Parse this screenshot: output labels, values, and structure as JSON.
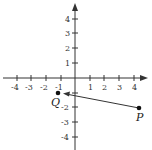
{
  "diagram": {
    "type": "coordinate-plane",
    "axes": {
      "x_ticks": [
        "-4",
        "-3",
        "-2",
        "-1",
        "1",
        "2",
        "3",
        "4"
      ],
      "y_ticks": [
        "4",
        "3",
        "2",
        "1",
        "-1",
        "-2",
        "-3",
        "-4"
      ],
      "x_range": [
        -4.5,
        4.8
      ],
      "y_range": [
        -4.8,
        5
      ]
    },
    "points": [
      {
        "label": "Q",
        "x": -1,
        "y": -1
      },
      {
        "label": "P",
        "x": 4.3,
        "y": -2
      }
    ],
    "vector": {
      "from": "P",
      "to": "Q",
      "description": "Arrow from P toward Q"
    },
    "colors": {
      "axis": "#333333",
      "line": "#333333",
      "point": "#111111",
      "background": "#ffffff"
    }
  }
}
